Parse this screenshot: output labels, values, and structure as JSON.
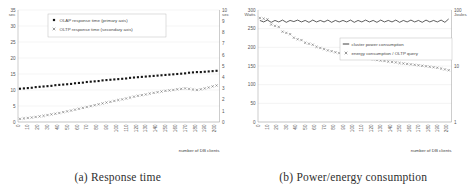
{
  "figure": {
    "subfigures": [
      {
        "caption": "(a) Response time",
        "xlabel": "number of DB clients",
        "left_unit": "sec",
        "right_unit": "sec",
        "legend": [
          {
            "marker": "filled-square",
            "label": "OLAP response time (primary axis)"
          },
          {
            "marker": "cross",
            "label": "OLTP response time (secondary axis)"
          }
        ]
      },
      {
        "caption": "(b) Power/energy consumption",
        "xlabel": "number of DB clients",
        "left_unit": "Watts",
        "right_unit": "Joules",
        "legend": [
          {
            "marker": "line",
            "label": "cluster power consumption"
          },
          {
            "marker": "cross",
            "label": "energy consumption / OLTP query"
          }
        ]
      }
    ]
  },
  "chart_data": [
    {
      "type": "scatter",
      "title": "(a) Response time",
      "xlabel": "number of DB clients",
      "ylabel": "sec",
      "y2label": "sec",
      "xlim": [
        0,
        205
      ],
      "ylim": [
        0,
        35
      ],
      "y2lim": [
        0,
        10
      ],
      "xticks": [
        0,
        10,
        20,
        30,
        40,
        50,
        60,
        70,
        80,
        90,
        100,
        110,
        120,
        130,
        140,
        150,
        160,
        170,
        180,
        190,
        200
      ],
      "yticks": [
        0,
        5,
        10,
        15,
        20,
        25,
        30,
        35
      ],
      "y2ticks": [
        0,
        1,
        2,
        3,
        4,
        5,
        6,
        7,
        8,
        9,
        10
      ],
      "grid": true,
      "legend_position": "top-center",
      "series": [
        {
          "name": "OLAP response time (primary axis)",
          "axis": "primary",
          "marker": "filled-square",
          "x": [
            2,
            6,
            10,
            14,
            18,
            22,
            26,
            30,
            34,
            38,
            42,
            46,
            50,
            54,
            58,
            62,
            66,
            70,
            74,
            78,
            82,
            86,
            90,
            94,
            98,
            102,
            106,
            110,
            114,
            118,
            122,
            126,
            130,
            134,
            138,
            142,
            146,
            150,
            154,
            158,
            162,
            166,
            170,
            174,
            178,
            182,
            186,
            190,
            194,
            198,
            202
          ],
          "values": [
            10.4,
            10.5,
            10.6,
            10.7,
            10.9,
            11.0,
            11.1,
            11.2,
            11.3,
            11.5,
            11.6,
            11.7,
            11.8,
            11.9,
            12.1,
            12.2,
            12.3,
            12.5,
            12.6,
            12.7,
            12.8,
            13.0,
            13.1,
            13.2,
            13.3,
            13.4,
            13.5,
            13.6,
            13.8,
            13.9,
            14.0,
            14.1,
            14.2,
            14.3,
            14.4,
            14.5,
            14.6,
            14.7,
            14.8,
            14.9,
            15.0,
            15.1,
            15.2,
            15.4,
            15.5,
            15.6,
            15.6,
            15.7,
            15.8,
            15.9,
            16.0
          ]
        },
        {
          "name": "OLTP response time (secondary axis)",
          "axis": "secondary",
          "marker": "cross",
          "x": [
            2,
            6,
            10,
            14,
            18,
            22,
            26,
            30,
            34,
            38,
            42,
            46,
            50,
            54,
            58,
            62,
            66,
            70,
            74,
            78,
            82,
            86,
            90,
            94,
            98,
            102,
            106,
            110,
            114,
            118,
            122,
            126,
            130,
            134,
            138,
            142,
            146,
            150,
            154,
            158,
            162,
            166,
            170,
            174,
            178,
            182,
            186,
            190,
            194,
            198,
            202
          ],
          "values": [
            0.28,
            0.32,
            0.36,
            0.4,
            0.45,
            0.5,
            0.55,
            0.62,
            0.68,
            0.74,
            0.8,
            0.88,
            0.95,
            1.02,
            1.1,
            1.18,
            1.26,
            1.34,
            1.42,
            1.5,
            1.58,
            1.66,
            1.74,
            1.8,
            1.88,
            1.96,
            2.02,
            2.1,
            2.18,
            2.26,
            2.34,
            2.4,
            2.46,
            2.54,
            2.6,
            2.66,
            2.72,
            2.78,
            2.82,
            2.86,
            2.92,
            2.96,
            3.0,
            2.96,
            2.9,
            2.86,
            2.92,
            3.0,
            3.08,
            3.18,
            3.26
          ]
        }
      ]
    },
    {
      "type": "line",
      "title": "(b) Power/energy consumption",
      "xlabel": "number of DB clients",
      "ylabel": "Watts",
      "y2label": "Joules",
      "xlim": [
        0,
        205
      ],
      "ylim": [
        0,
        300
      ],
      "y2lim": [
        1,
        100
      ],
      "y2scale": "log",
      "xticks": [
        0,
        10,
        20,
        30,
        40,
        50,
        60,
        70,
        80,
        90,
        100,
        110,
        120,
        130,
        140,
        150,
        160,
        170,
        180,
        190,
        200
      ],
      "yticks": [
        0,
        50,
        100,
        150,
        200,
        250,
        300
      ],
      "y2ticks": [
        1,
        10,
        100
      ],
      "grid": true,
      "legend_position": "center",
      "series": [
        {
          "name": "cluster power consumption",
          "axis": "primary",
          "marker": "line",
          "x": [
            2,
            6,
            10,
            14,
            18,
            22,
            26,
            30,
            34,
            38,
            42,
            46,
            50,
            54,
            58,
            62,
            66,
            70,
            74,
            78,
            82,
            86,
            90,
            94,
            98,
            102,
            106,
            110,
            114,
            118,
            122,
            126,
            130,
            134,
            138,
            142,
            146,
            150,
            154,
            158,
            162,
            166,
            170,
            174,
            178,
            182,
            186,
            190,
            194,
            198,
            202
          ],
          "values": [
            272,
            268,
            273,
            267,
            272,
            268,
            273,
            267,
            272,
            269,
            273,
            268,
            272,
            267,
            273,
            268,
            272,
            268,
            273,
            267,
            272,
            268,
            272,
            268,
            273,
            267,
            272,
            268,
            273,
            268,
            272,
            267,
            273,
            268,
            272,
            268,
            273,
            267,
            272,
            268,
            273,
            268,
            272,
            267,
            273,
            268,
            272,
            268,
            273,
            267,
            276
          ]
        },
        {
          "name": "energy consumption / OLTP query",
          "axis": "secondary",
          "marker": "cross",
          "x": [
            2,
            6,
            10,
            14,
            18,
            22,
            26,
            30,
            34,
            38,
            42,
            46,
            50,
            54,
            58,
            62,
            66,
            70,
            74,
            78,
            82,
            86,
            90,
            94,
            98,
            102,
            106,
            110,
            114,
            118,
            122,
            126,
            130,
            134,
            138,
            142,
            146,
            150,
            154,
            158,
            162,
            166,
            170,
            174,
            178,
            182,
            186,
            190,
            194,
            198,
            202
          ],
          "values": [
            72,
            70,
            68,
            55,
            52,
            50,
            41,
            39,
            37,
            32,
            30,
            29,
            26,
            25,
            24,
            22,
            21,
            20,
            19,
            18.4,
            17.6,
            17,
            16.4,
            15.8,
            15.3,
            14.9,
            14.4,
            14,
            13.7,
            13.4,
            13.1,
            12.8,
            12.5,
            12.3,
            12,
            11.8,
            11.6,
            11.3,
            11.1,
            10.9,
            10.7,
            10.5,
            10.3,
            10.1,
            9.9,
            9.7,
            9.5,
            9.3,
            9.0,
            8.7,
            8.4
          ]
        }
      ]
    }
  ]
}
